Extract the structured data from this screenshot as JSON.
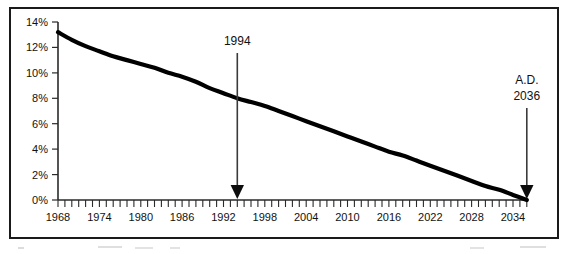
{
  "chart_data": {
    "type": "line",
    "title": "",
    "subtitle": "",
    "xlabel": "",
    "ylabel": "",
    "grid": false,
    "legend": "none",
    "xlim": [
      1968,
      2036
    ],
    "ylim": [
      0,
      14
    ],
    "x_tick_labels": [
      "1968",
      "1974",
      "1980",
      "1986",
      "1992",
      "1998",
      "2004",
      "2010",
      "2016",
      "2022",
      "2028",
      "2034"
    ],
    "x_tick_values": [
      1968,
      1974,
      1980,
      1986,
      1992,
      1998,
      2004,
      2010,
      2016,
      2022,
      2028,
      2034
    ],
    "x_minor_tick_interval": 1,
    "y_tick_labels": [
      "0%",
      "2%",
      "4%",
      "6%",
      "8%",
      "10%",
      "12%",
      "14%"
    ],
    "y_tick_values": [
      0,
      2,
      4,
      6,
      8,
      10,
      12,
      14
    ],
    "series": [
      {
        "name": "declining-percentage",
        "x": [
          1968,
          1970,
          1972,
          1974,
          1976,
          1978,
          1980,
          1982,
          1984,
          1986,
          1988,
          1990,
          1992,
          1994,
          1996,
          1998,
          2000,
          2002,
          2004,
          2006,
          2008,
          2010,
          2012,
          2014,
          2016,
          2018,
          2020,
          2022,
          2024,
          2026,
          2028,
          2030,
          2032,
          2034,
          2036
        ],
        "values": [
          13.2,
          12.6,
          12.1,
          11.7,
          11.3,
          11.0,
          10.7,
          10.4,
          10.0,
          9.7,
          9.3,
          8.8,
          8.4,
          8.0,
          7.7,
          7.4,
          7.0,
          6.6,
          6.2,
          5.8,
          5.4,
          5.0,
          4.6,
          4.2,
          3.8,
          3.5,
          3.1,
          2.7,
          2.3,
          1.9,
          1.5,
          1.1,
          0.8,
          0.4,
          0.0
        ]
      }
    ],
    "annotations": [
      {
        "id": "marker-1994",
        "label": "1994",
        "x_value": 1994,
        "y_value": 8.0,
        "points_to": "x-axis"
      },
      {
        "id": "marker-2036",
        "label_line_1": "A.D.",
        "label_line_2": "2036",
        "x_value": 2036,
        "y_value": 0.0,
        "points_to": "curve-endpoint"
      }
    ],
    "colors": {
      "curve": "#000000",
      "axis": "#2a2a2a",
      "frame": "#1a1a1a",
      "text": "#111111",
      "background": "#ffffff"
    }
  }
}
